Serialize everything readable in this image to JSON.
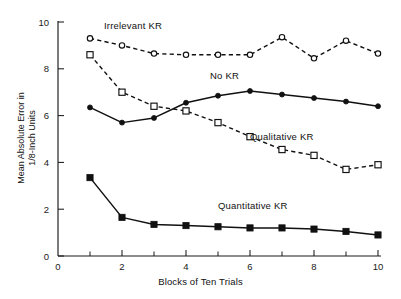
{
  "chart_data": {
    "type": "line",
    "title": "",
    "subtitle": "",
    "xlabel": "Blocks of Ten Trials",
    "ylabel_line1": "Mean Absolute Error in",
    "ylabel_line2": "1/8-Inch Units",
    "ylabel": "Mean Absolute Error in 1/8-Inch Units",
    "x": [
      1,
      2,
      3,
      4,
      5,
      6,
      7,
      8,
      9,
      10
    ],
    "categories": [
      "1",
      "2",
      "3",
      "4",
      "5",
      "6",
      "7",
      "8",
      "9",
      "10"
    ],
    "xlim": [
      0,
      10
    ],
    "ylim": [
      0,
      10
    ],
    "x_major_ticks": [
      0,
      2,
      4,
      6,
      8,
      10
    ],
    "x_major_tick_labels": [
      "0",
      "2",
      "4",
      "6",
      "8",
      "10"
    ],
    "x_minor_ticks": [
      1,
      3,
      5,
      7,
      9
    ],
    "y_major_ticks": [
      0,
      2,
      4,
      6,
      8,
      10
    ],
    "y_major_tick_labels": [
      "0",
      "2",
      "4",
      "6",
      "8",
      "10"
    ],
    "grid": false,
    "legend_position": "inline-annotations",
    "series": [
      {
        "name": "Irrelevant KR",
        "marker": "open-circle",
        "line_style": "dashed",
        "color": "#111111",
        "values": [
          9.3,
          9.0,
          8.65,
          8.6,
          8.6,
          8.6,
          9.35,
          8.45,
          9.2,
          8.65
        ],
        "label_x": 5.8,
        "label_y": 97
      },
      {
        "name": "Qualitative KR",
        "marker": "open-square",
        "line_style": "dashed",
        "color": "#111111",
        "values": [
          8.6,
          7.0,
          6.4,
          6.2,
          5.7,
          5.1,
          4.55,
          4.3,
          3.7,
          3.9
        ],
        "label_x": 251,
        "label_y": 136
      },
      {
        "name": "No KR",
        "marker": "filled-circle",
        "line_style": "solid",
        "color": "#111111",
        "values": [
          6.35,
          5.7,
          5.9,
          6.55,
          6.85,
          7.05,
          6.9,
          6.75,
          6.6,
          6.4
        ],
        "label_x": 211,
        "label_y": 73
      },
      {
        "name": "Quantitative KR",
        "marker": "filled-square",
        "line_style": "solid",
        "color": "#111111",
        "values": [
          3.35,
          1.65,
          1.35,
          1.3,
          1.25,
          1.2,
          1.2,
          1.15,
          1.05,
          0.9
        ],
        "label_x": 221,
        "label_y": 205
      }
    ],
    "annotations": [
      {
        "text": "Irrelevant  KR",
        "x": 104,
        "y": 20
      },
      {
        "text": "No  KR",
        "x": 210,
        "y": 70
      },
      {
        "text": "Qualitative  KR",
        "x": 250,
        "y": 131
      },
      {
        "text": "Quantitative  KR",
        "x": 218,
        "y": 200
      }
    ]
  }
}
